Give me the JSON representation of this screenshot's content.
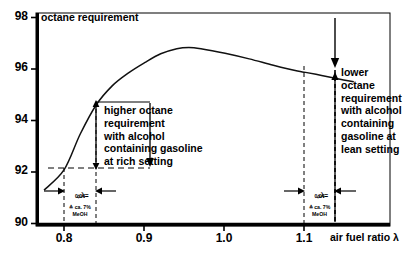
{
  "chart_data": {
    "type": "line",
    "title": "octane requirement",
    "xlabel": "air fuel ratio λ",
    "ylabel": "octane requirement",
    "xlim": [
      0.765,
      1.205
    ],
    "ylim": [
      90,
      98.3
    ],
    "xticks": [
      0.8,
      0.9,
      1.0,
      1.1
    ],
    "xtick_labels": [
      "0.8",
      "0.9",
      "1.0",
      "1.1"
    ],
    "yticks": [
      90,
      92,
      94,
      96,
      98
    ],
    "ytick_labels": [
      "90",
      "92",
      "94",
      "96",
      "98"
    ],
    "grid": false,
    "legend": null,
    "series": [
      {
        "name": "octane requirement",
        "x": [
          0.775,
          0.8,
          0.82,
          0.84,
          0.86,
          0.88,
          0.9,
          0.92,
          0.94,
          0.955,
          0.97,
          1.0,
          1.03,
          1.06,
          1.09,
          1.1,
          1.12,
          1.14,
          1.16
        ],
        "y": [
          91.35,
          92.15,
          93.55,
          94.7,
          95.45,
          95.95,
          96.35,
          96.7,
          96.9,
          96.95,
          96.9,
          96.72,
          96.5,
          96.25,
          96.02,
          95.97,
          95.85,
          95.72,
          95.6
        ]
      }
    ],
    "annotations": [
      {
        "name": "rich-setting-note",
        "text": "higher octane\nrequirement\nwith alcohol\ncontaining gasoline\nat rich setting",
        "x": 0.84,
        "y_from": 92.15,
        "y_to": 94.7
      },
      {
        "name": "lean-setting-note",
        "text": "lower\noctane\nrequirement\nwith alcohol\ncontaining\ngasoline at\nlean setting",
        "x": 1.14,
        "y_from": 90.0,
        "y_to": 95.72
      }
    ],
    "delta_markers": [
      {
        "name": "rich-delta",
        "symbol": "▵λ=",
        "value": "0,04",
        "equiv_line1": "≙ ca. 7%",
        "equiv_line2": "MeOH",
        "x_from": 0.8,
        "x_to": 0.84
      },
      {
        "name": "lean-delta",
        "symbol": "▵λ=",
        "value": "0,04",
        "equiv_line1": "≙ ca. 7%",
        "equiv_line2": "MeOH",
        "x_from": 1.1,
        "x_to": 1.14
      }
    ],
    "colors": {
      "ink": "#000000",
      "background": "#ffffff",
      "curve": "#111111",
      "dashed": "#333333"
    }
  }
}
